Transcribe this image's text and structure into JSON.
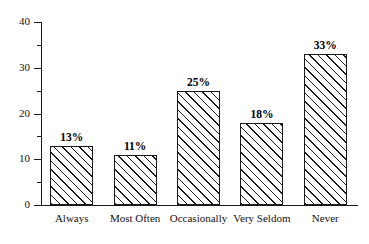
{
  "chart_data": {
    "type": "bar",
    "title": "",
    "xlabel": "",
    "ylabel": "",
    "categories": [
      "Always",
      "Most Often",
      "Occasionally",
      "Very Seldom",
      "Never"
    ],
    "values": [
      13,
      11,
      25,
      18,
      33
    ],
    "data_labels": [
      "13%",
      "11%",
      "25%",
      "18%",
      "33%"
    ],
    "ylim": [
      0,
      40
    ],
    "ytick_labels": [
      "0",
      "10",
      "20",
      "30",
      "40"
    ],
    "ytick_values": [
      0,
      10,
      20,
      30,
      40
    ],
    "yminor_ticks": [
      5,
      15,
      25,
      35
    ],
    "grid": false,
    "legend": false,
    "bar_fill": "#ffffff",
    "bar_edge": "#1a1a1a",
    "hatch": "diagonal-forward-slash"
  }
}
